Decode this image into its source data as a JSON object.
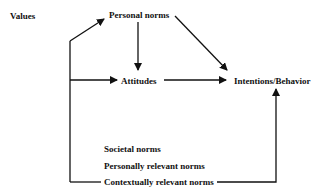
{
  "diagram": {
    "nodes": {
      "values": "Values",
      "personal_norms": "Personal norms",
      "attitudes": "Attitudes",
      "intentions_behavior": "Intentions/Behavior",
      "societal_norms": "Societal norms",
      "personally_relevant_norms": "Personally relevant norms",
      "contextually_relevant_norms": "Contextually relevant norms"
    },
    "edges": [
      {
        "from": "values",
        "to": "personal_norms"
      },
      {
        "from": "values",
        "to": "attitudes"
      },
      {
        "from": "personal_norms",
        "to": "attitudes"
      },
      {
        "from": "personal_norms",
        "to": "intentions_behavior"
      },
      {
        "from": "attitudes",
        "to": "intentions_behavior"
      },
      {
        "from": "contextually_relevant_norms",
        "to": "intentions_behavior"
      }
    ],
    "colors": {
      "line": "#111111",
      "background": "#ffffff"
    }
  }
}
